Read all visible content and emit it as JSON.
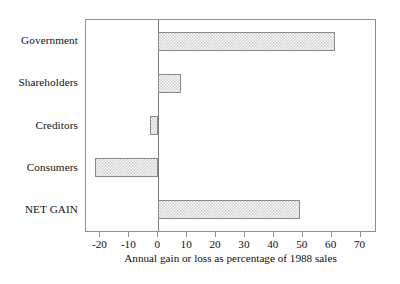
{
  "chart_data": {
    "type": "bar",
    "orientation": "horizontal",
    "title": "",
    "subtitle": "",
    "xlabel": "Annual gain or loss as percentage of 1988 sales",
    "ylabel": "",
    "categories": [
      "Government",
      "Shareholders",
      "Creditors",
      "Consumers",
      "NET GAIN"
    ],
    "values": [
      61,
      8,
      -3,
      -22,
      49
    ],
    "xlim": [
      -25,
      75
    ],
    "xticks": [
      -20,
      -10,
      0,
      10,
      20,
      30,
      40,
      50,
      60,
      70
    ],
    "xtick_labels": [
      "-20",
      "-10",
      "0",
      "10",
      "20",
      "30",
      "40",
      "50",
      "60",
      "70"
    ],
    "grid": false,
    "legend": null,
    "series": [
      {
        "name": "Annual gain or loss as percentage of 1988 sales",
        "values": [
          61,
          8,
          -3,
          -22,
          49
        ]
      }
    ],
    "bars": [
      {
        "label": "Government",
        "value": 61,
        "emphasis": false
      },
      {
        "label": "Shareholders",
        "value": 8,
        "emphasis": false
      },
      {
        "label": "Creditors",
        "value": -3,
        "emphasis": false
      },
      {
        "label": "Consumers",
        "value": -22,
        "emphasis": false
      },
      {
        "label": "NET GAIN",
        "value": 49,
        "emphasis": true
      }
    ],
    "colors": {
      "bar_fill": "#d6d6d6",
      "bar_edge": "#8a8a8a",
      "axis": "#8d8d8d",
      "text": "#111111",
      "background": "#ffffff"
    }
  },
  "axis": {
    "x_title": "Annual gain or loss as percentage of 1988 sales"
  },
  "labels": {
    "government": "Government",
    "shareholders": "Shareholders",
    "creditors": "Creditors",
    "consumers": "Consumers",
    "net_gain": "NET GAIN"
  },
  "ticks": {
    "t0": "-20",
    "t1": "-10",
    "t2": "0",
    "t3": "10",
    "t4": "20",
    "t5": "30",
    "t6": "40",
    "t7": "50",
    "t8": "60",
    "t9": "70"
  }
}
